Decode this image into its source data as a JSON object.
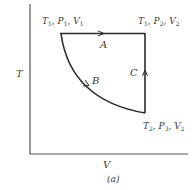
{
  "diagram": {
    "type": "thermodynamic-cycle-TV",
    "axes": {
      "y_label": "T",
      "x_label": "V"
    },
    "caption": "(a)",
    "states": [
      {
        "id": "1",
        "label_T": "T",
        "T_sub": "1",
        "label_P": "P",
        "P_sub": "1",
        "label_V": "V",
        "V_sub": "1",
        "text": "T1, P1, V1"
      },
      {
        "id": "2",
        "label_T": "T",
        "T_sub": "1",
        "label_P": "P",
        "P_sub": "2",
        "label_V": "V",
        "V_sub": "2",
        "text": "T1, P2, V2"
      },
      {
        "id": "3",
        "label_T": "T",
        "T_sub": "2",
        "label_P": "P",
        "P_sub": "3",
        "label_V": "V",
        "V_sub": "2",
        "text": "T2, P3, V2"
      }
    ],
    "paths": [
      {
        "id": "A",
        "label": "A",
        "from": "1",
        "to": "2",
        "kind": "isothermal"
      },
      {
        "id": "B",
        "label": "B",
        "from": "1",
        "to": "3",
        "kind": "curve"
      },
      {
        "id": "C",
        "label": "C",
        "from": "3",
        "to": "2",
        "kind": "isochoric"
      }
    ],
    "colors": {
      "line": "#2a2a2a",
      "axis": "#555555",
      "text": "#3a3a3a"
    }
  }
}
